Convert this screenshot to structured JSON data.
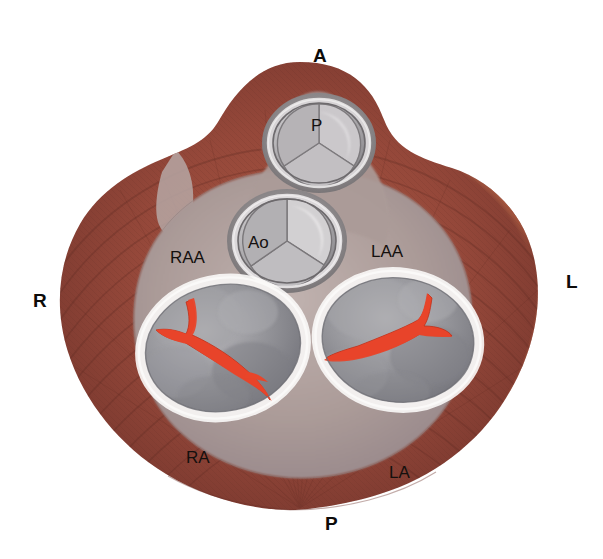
{
  "figure": {
    "name": "cardiac-base-cross-section",
    "background_color": "#ffffff"
  },
  "orientation_markers": [
    {
      "id": "anterior",
      "label": "A",
      "meaning": "Anterior",
      "x": 313,
      "y": 46
    },
    {
      "id": "right",
      "label": "R",
      "meaning": "Right",
      "x": 33,
      "y": 291
    },
    {
      "id": "left",
      "label": "L",
      "meaning": "Left",
      "x": 566,
      "y": 272
    },
    {
      "id": "posterior",
      "label": "P",
      "meaning": "Posterior",
      "x": 325,
      "y": 514
    }
  ],
  "anatomy_labels": [
    {
      "id": "pulmonary-valve",
      "label": "P",
      "meaning": "Pulmonary valve",
      "x": 311,
      "y": 117
    },
    {
      "id": "aortic-valve",
      "label": "Ao",
      "meaning": "Aortic valve",
      "x": 248,
      "y": 234
    },
    {
      "id": "right-atrial-appendage",
      "label": "RAA",
      "meaning": "Right atrial appendage",
      "x": 170,
      "y": 249
    },
    {
      "id": "left-atrial-appendage",
      "label": "LAA",
      "meaning": "Left atrial appendage",
      "x": 371,
      "y": 243
    },
    {
      "id": "right-atrium",
      "label": "RA",
      "meaning": "Right atrium",
      "x": 186,
      "y": 449
    },
    {
      "id": "left-atrium",
      "label": "LA",
      "meaning": "Left atrium",
      "x": 389,
      "y": 464
    }
  ],
  "structures": [
    {
      "id": "myocardium",
      "name": "Myocardium",
      "color": "#8e4236"
    },
    {
      "id": "myocardium-left",
      "name": "Left myocardial wall",
      "color": "#a9523a"
    },
    {
      "id": "fibrous-skeleton",
      "name": "Fibrous skeleton",
      "color": "#ab9a97"
    },
    {
      "id": "tricuspid-valve",
      "name": "Tricuspid valve orifice",
      "color": "#8d8d91"
    },
    {
      "id": "mitral-valve",
      "name": "Mitral valve orifice",
      "color": "#8d8d91"
    },
    {
      "id": "valve-leaflet-line",
      "name": "Valve coaptation line",
      "color": "#e8452a"
    },
    {
      "id": "annulus-ring",
      "name": "Valve annulus",
      "color": "#f2eeed"
    },
    {
      "id": "semilunar-cusp",
      "name": "Semilunar valve cusp",
      "color": "#c9c7c9"
    }
  ],
  "palette": {
    "myocardium_dark": "#7b3a31",
    "myocardium_mid": "#94493a",
    "myocardium_light": "#b05c41",
    "fibrous_pale": "#b3a4a1",
    "valve_gray": "#8e8e93",
    "valve_gray_light": "#b9b8bc",
    "leaflet_red": "#e8452a",
    "ring_white": "#f4f1f0",
    "text_black": "#141110"
  }
}
